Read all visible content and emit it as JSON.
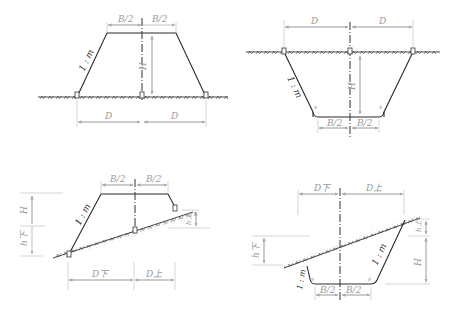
{
  "figures": [
    {
      "id": "fill-flat",
      "description": "Embankment (fill) on flat ground",
      "labels": {
        "half_width_left": "B/2",
        "half_width_right": "B/2",
        "slope": "1 : m",
        "height": "H",
        "dist_left": "D",
        "dist_right": "D"
      }
    },
    {
      "id": "cut-flat",
      "description": "Excavation (cut) on flat ground",
      "labels": {
        "dist_left": "D",
        "dist_right": "D",
        "slope": "1 : m",
        "height": "H",
        "half_width_left": "B/2",
        "half_width_right": "B/2",
        "ditch_left": "s",
        "ditch_right": "s"
      }
    },
    {
      "id": "fill-slope",
      "description": "Embankment (fill) on sloping ground",
      "labels": {
        "half_width_left": "B/2",
        "half_width_right": "B/2",
        "slope": "1 : m",
        "height": "H",
        "h_lower": "h下",
        "h_upper": "h上",
        "dist_lower": "D下",
        "dist_upper": "D上"
      }
    },
    {
      "id": "cut-slope",
      "description": "Excavation (cut) on sloping ground",
      "labels": {
        "dist_lower": "D下",
        "dist_upper": "D上",
        "slope_left": "1 : m",
        "slope_right": "1 : m",
        "h_lower": "h下",
        "h_upper": "h上",
        "height": "H",
        "half_width_left": "B/2",
        "half_width_right": "B/2",
        "ditch_left": "s",
        "ditch_right": "s"
      }
    }
  ]
}
